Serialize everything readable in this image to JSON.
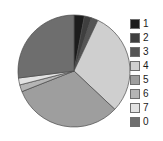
{
  "chart_data": {
    "type": "pie",
    "title": "",
    "subtitle": "",
    "xlabel": "",
    "ylabel": "",
    "grid": false,
    "legend_position": "right",
    "start_angle": 90,
    "direction": "clockwise",
    "categories": [
      "1",
      "2",
      "3",
      "4",
      "5",
      "6",
      "7",
      "0"
    ],
    "values": [
      3,
      2,
      2,
      30,
      32,
      2,
      2,
      27
    ],
    "percentages": [
      3.0,
      2.0,
      2.0,
      30.0,
      32.0,
      2.0,
      2.0,
      27.0
    ],
    "slice_colors": [
      "#1c1c1c",
      "#3f3f3f",
      "#555555",
      "#cfcfcf",
      "#9e9e9e",
      "#b5b5b5",
      "#e2e2e2",
      "#6e6e6e"
    ],
    "slice_edge_color": "#4a4a4a",
    "series": [
      {
        "name": "share",
        "values": [
          3,
          2,
          2,
          30,
          32,
          2,
          2,
          27
        ]
      }
    ]
  },
  "legend": {
    "entries": [
      {
        "label": "1",
        "color": "#1c1c1c"
      },
      {
        "label": "2",
        "color": "#3f3f3f"
      },
      {
        "label": "3",
        "color": "#555555"
      },
      {
        "label": "4",
        "color": "#cfcfcf"
      },
      {
        "label": "5",
        "color": "#9e9e9e"
      },
      {
        "label": "6",
        "color": "#b5b5b5"
      },
      {
        "label": "7",
        "color": "#e2e2e2"
      },
      {
        "label": "0",
        "color": "#6e6e6e"
      }
    ]
  },
  "figure": {
    "background": "#ffffff",
    "pie_center_x": 57,
    "pie_center_y": 57,
    "pie_radius": 56
  }
}
